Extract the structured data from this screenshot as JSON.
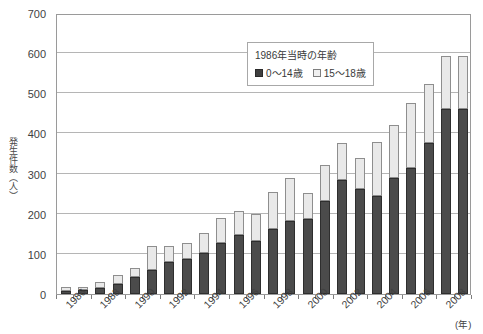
{
  "chart_data": {
    "type": "bar",
    "stacked": true,
    "title": "",
    "xlabel": "(年)",
    "ylabel": "発生件数（人）",
    "ylim": [
      0,
      700
    ],
    "ytick_step": 100,
    "yticks": [
      0,
      100,
      200,
      300,
      400,
      500,
      600,
      700
    ],
    "grid": true,
    "legend_position": "top-center",
    "legend_title": "1986年当時の年齢",
    "categories": [
      "1986",
      "1987",
      "1988",
      "1989",
      "1990",
      "1991",
      "1992",
      "1993",
      "1994",
      "1995",
      "1996",
      "1997",
      "1998",
      "1999",
      "2000",
      "2001",
      "2002",
      "2003",
      "2004",
      "2005",
      "2006",
      "2007",
      "2008",
      "2009"
    ],
    "tick_labels_shown": [
      "1986",
      "1988",
      "1990",
      "1992",
      "1994",
      "1996",
      "1998",
      "2000",
      "2002",
      "2004",
      "2006",
      "2008"
    ],
    "series": [
      {
        "name": "0～14歳",
        "color": "#4b4b4b",
        "values": [
          8,
          9,
          14,
          26,
          42,
          61,
          80,
          86,
          101,
          126,
          146,
          133,
          163,
          183,
          186,
          232,
          285,
          262,
          245,
          289,
          315,
          375,
          462,
          462
        ]
      },
      {
        "name": "15～18歳",
        "color": "#e9e9e9",
        "values": [
          9,
          8,
          15,
          22,
          23,
          59,
          39,
          42,
          51,
          64,
          60,
          67,
          90,
          107,
          65,
          90,
          91,
          76,
          134,
          132,
          161,
          147,
          131,
          131
        ]
      }
    ],
    "totals": [
      17,
      17,
      29,
      48,
      65,
      120,
      119,
      128,
      152,
      190,
      206,
      200,
      253,
      290,
      251,
      322,
      376,
      338,
      379,
      421,
      476,
      522,
      593,
      593
    ]
  },
  "axis": {
    "y_title": "発生件数（人）",
    "x_unit": "(年)"
  },
  "legend": {
    "title": "1986年当時の年齢",
    "entries": [
      {
        "label": "0～14歳",
        "swatch": "dark"
      },
      {
        "label": "15～18歳",
        "swatch": "light"
      }
    ]
  },
  "colors": {
    "series_low": "#4b4b4b",
    "series_high": "#e9e9e9",
    "gridline": "#b5b5b5",
    "axis_border": "#9a9a9a",
    "text": "#3a3a3a",
    "background": "#ffffff"
  }
}
